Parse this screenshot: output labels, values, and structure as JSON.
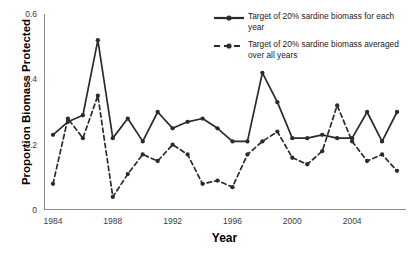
{
  "chart_data": {
    "type": "line",
    "title": "",
    "xlabel": "Year",
    "ylabel": "Proportion Biomass Protected",
    "xlim": [
      1983.4,
      2007.6
    ],
    "ylim": [
      0,
      0.6
    ],
    "yticks": [
      "0",
      "0.2",
      "0.4",
      "0.6"
    ],
    "ytick_values": [
      0,
      0.2,
      0.4,
      0.6
    ],
    "xticks": [
      "1984",
      "1988",
      "1992",
      "1996",
      "2000",
      "2004"
    ],
    "xtick_values": [
      1984,
      1988,
      1992,
      1996,
      2000,
      2004
    ],
    "grid": false,
    "legend_position": "top-right",
    "x": [
      1984,
      1985,
      1986,
      1987,
      1988,
      1989,
      1990,
      1991,
      1992,
      1993,
      1994,
      1995,
      1996,
      1997,
      1998,
      1999,
      2000,
      2001,
      2002,
      2003,
      2004,
      2005,
      2006,
      2007
    ],
    "series": [
      {
        "name": "Target of 20% sardine biomass for each year",
        "line_style": "solid",
        "color": "#2b2b2b",
        "marker": "circle",
        "values": [
          0.23,
          0.27,
          0.29,
          0.52,
          0.22,
          0.28,
          0.21,
          0.3,
          0.25,
          0.27,
          0.28,
          0.25,
          0.21,
          0.21,
          0.42,
          0.33,
          0.22,
          0.22,
          0.23,
          0.22,
          0.22,
          0.3,
          0.21,
          0.3
        ]
      },
      {
        "name": "Target of 20% sardine biomass averaged over all years",
        "line_style": "dashed",
        "color": "#2b2b2b",
        "marker": "circle",
        "values": [
          0.08,
          0.28,
          0.22,
          0.35,
          0.04,
          0.11,
          0.17,
          0.15,
          0.2,
          0.17,
          0.08,
          0.09,
          0.07,
          0.17,
          0.21,
          0.24,
          0.16,
          0.14,
          0.18,
          0.32,
          0.21,
          0.15,
          0.17,
          0.12
        ]
      }
    ]
  },
  "legend": {
    "items": [
      {
        "label": "Target of 20% sardine biomass for each year",
        "style": "solid"
      },
      {
        "label": "Target of 20% sardine biomass averaged over all years",
        "style": "dashed"
      }
    ]
  }
}
